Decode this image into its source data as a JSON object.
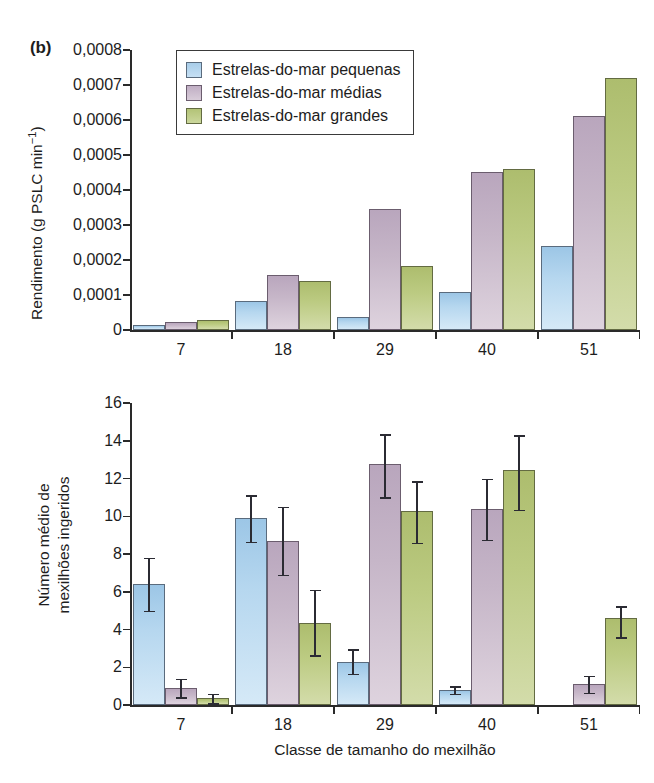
{
  "panel": {
    "label": "(b)"
  },
  "legend": {
    "position": "top-left-inside",
    "entries": [
      {
        "label": "Estrelas-do-mar pequenas",
        "color": "#b8d8ee",
        "series_key": "pequenas"
      },
      {
        "label": "Estrelas-do-mar médias",
        "color": "#c6b6c8",
        "series_key": "medias"
      },
      {
        "label": "Estrelas-do-mar grandes",
        "color": "#bccb82",
        "series_key": "grandes"
      }
    ]
  },
  "chart_data": [
    {
      "id": "top",
      "type": "bar",
      "title": "",
      "xlabel": "",
      "ylabel": "Rendimento (g PSLC min⁻¹)",
      "ylabel_main": "Rendimento (g PSLC min",
      "ylabel_exp": "−1",
      "ylabel_tail": ")",
      "categories": [
        "7",
        "18",
        "29",
        "40",
        "51"
      ],
      "ylim": [
        0,
        0.0008
      ],
      "yticks": [
        0,
        0.0001,
        0.0002,
        0.0003,
        0.0004,
        0.0005,
        0.0006,
        0.0007,
        0.0008
      ],
      "ytick_labels": [
        "0",
        "0,0001",
        "0,0002",
        "0,0003",
        "0,0004",
        "0,0005",
        "0,0006",
        "0,0007",
        "0,0008"
      ],
      "xtick_labels": [
        "7",
        "18",
        "29",
        "40",
        "51"
      ],
      "grid": false,
      "series": [
        {
          "name": "Estrelas-do-mar pequenas",
          "values": [
            1.3e-05,
            8.3e-05,
            3.7e-05,
            0.000108,
            0.000239
          ]
        },
        {
          "name": "Estrelas-do-mar médias",
          "values": [
            2.2e-05,
            0.000158,
            0.000345,
            0.000452,
            0.000611
          ]
        },
        {
          "name": "Estrelas-do-mar grandes",
          "values": [
            3e-05,
            0.000139,
            0.000182,
            0.000459,
            0.00072
          ]
        }
      ]
    },
    {
      "id": "bottom",
      "type": "bar",
      "title": "",
      "xlabel": "Classe de tamanho do mexilhão",
      "ylabel": "Número médio de mexilhões ingeridos",
      "ylabel_line1": "Número médio de",
      "ylabel_line2": "mexilhões ingeridos",
      "categories": [
        "7",
        "18",
        "29",
        "40",
        "51"
      ],
      "ylim": [
        0,
        16
      ],
      "yticks": [
        0,
        2,
        4,
        6,
        8,
        10,
        12,
        14,
        16
      ],
      "ytick_labels": [
        "0",
        "2",
        "4",
        "6",
        "8",
        "10",
        "12",
        "14",
        "16"
      ],
      "xtick_labels": [
        "7",
        "18",
        "29",
        "40",
        "51"
      ],
      "grid": false,
      "errorbars": true,
      "series": [
        {
          "name": "Estrelas-do-mar pequenas",
          "values": [
            6.4,
            9.9,
            2.3,
            0.8,
            null
          ],
          "err_low": [
            1.4,
            1.25,
            0.65,
            0.2,
            null
          ],
          "err_high": [
            1.4,
            1.2,
            0.65,
            0.2,
            null
          ]
        },
        {
          "name": "Estrelas-do-mar médias",
          "values": [
            0.9,
            8.7,
            12.75,
            10.4,
            1.1
          ],
          "err_low": [
            0.5,
            1.8,
            1.75,
            1.65,
            0.45
          ],
          "err_high": [
            0.5,
            1.8,
            1.6,
            1.6,
            0.45
          ]
        },
        {
          "name": "Estrelas-do-mar grandes",
          "values": [
            0.35,
            4.35,
            10.3,
            12.45,
            4.6
          ],
          "err_low": [
            0.25,
            1.7,
            1.7,
            2.1,
            1.0
          ],
          "err_high": [
            0.25,
            1.75,
            1.55,
            1.85,
            0.65
          ]
        }
      ]
    }
  ]
}
